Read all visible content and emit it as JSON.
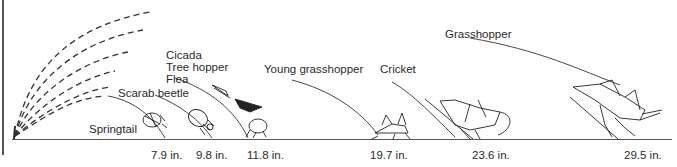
{
  "diagram": {
    "unit": "in.",
    "insects": [
      {
        "name": "Springtail",
        "distance": "7.9 in."
      },
      {
        "name": "Scarab beetle",
        "distance": "9.8 in."
      },
      {
        "name": "Cicada",
        "distance": "11.8 in."
      },
      {
        "name": "Tree hopper",
        "distance": "11.8 in."
      },
      {
        "name": "Flea",
        "distance": "11.8 in."
      },
      {
        "name": "Young grasshopper",
        "distance": "19.7 in."
      },
      {
        "name": "Cricket",
        "distance": "23.6 in."
      },
      {
        "name": "Grasshopper",
        "distance": "29.5 in."
      }
    ],
    "labels": {
      "springtail": "Springtail",
      "scarab": "Scarab beetle",
      "cicada": "Cicada",
      "treehopper": "Tree hopper",
      "flea": "Flea",
      "young_grasshopper": "Young grasshopper",
      "cricket": "Cricket",
      "grasshopper": "Grasshopper"
    },
    "distances": {
      "d1": "7.9 in.",
      "d2": "9.8 in.",
      "d3": "11.8 in.",
      "d4": "19.7 in.",
      "d5": "23.6 in.",
      "d6": "29.5 in."
    },
    "colors": {
      "ink": "#2a2a2a",
      "background": "#ffffff"
    }
  }
}
